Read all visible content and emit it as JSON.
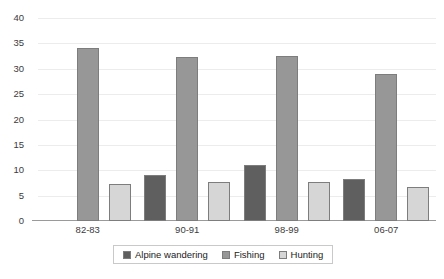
{
  "chart_data": {
    "type": "bar",
    "title": "",
    "subtitle": "",
    "xlabel": "",
    "ylabel": "",
    "categories": [
      "82-83",
      "90-91",
      "98-99",
      "06-07"
    ],
    "series": [
      {
        "name": "Alpine wandering",
        "color": "#5f5f5f",
        "values": [
          null,
          9.1,
          11.1,
          8.2
        ]
      },
      {
        "name": "Fishing",
        "color": "#979797",
        "values": [
          34.0,
          32.3,
          32.5,
          28.9
        ]
      },
      {
        "name": "Hunting",
        "color": "#d6d6d6",
        "values": [
          7.3,
          7.6,
          7.6,
          6.8
        ]
      }
    ],
    "ylim": [
      0,
      40
    ],
    "yticks": [
      0,
      5,
      10,
      15,
      20,
      25,
      30,
      35,
      40
    ],
    "ytick_labels": [
      "0",
      "5",
      "10",
      "15",
      "20",
      "25",
      "30",
      "35",
      "40"
    ],
    "grid": true,
    "legend_position": "bottom",
    "bar_border_color": "#7d7d7d",
    "gridline_color": "#ececec",
    "axis_color": "#9a9a9a",
    "background": "#ffffff"
  }
}
